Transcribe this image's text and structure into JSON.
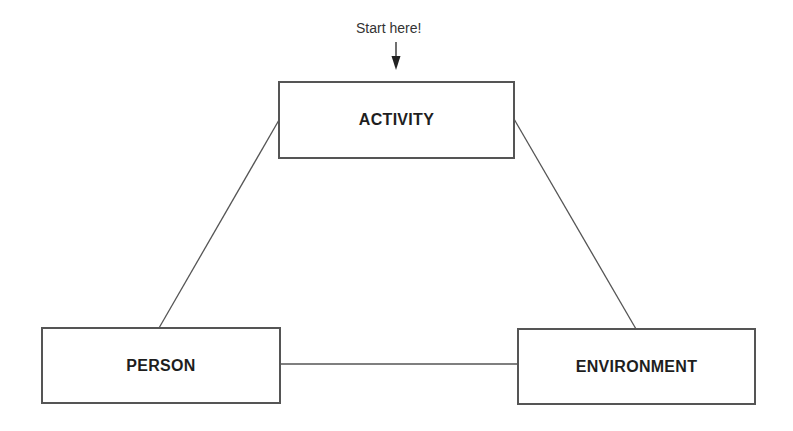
{
  "diagram": {
    "annotation": {
      "text": "Start here!",
      "icon": "down-arrow-icon"
    },
    "nodes": [
      {
        "id": "activity",
        "label": "ACTIVITY"
      },
      {
        "id": "person",
        "label": "PERSON"
      },
      {
        "id": "environment",
        "label": "ENVIRONMENT"
      }
    ],
    "edges": [
      {
        "from": "activity",
        "to": "person"
      },
      {
        "from": "activity",
        "to": "environment"
      },
      {
        "from": "person",
        "to": "environment"
      }
    ],
    "colors": {
      "line": "#555555",
      "text": "#1e1e1e",
      "background": "#ffffff"
    }
  }
}
